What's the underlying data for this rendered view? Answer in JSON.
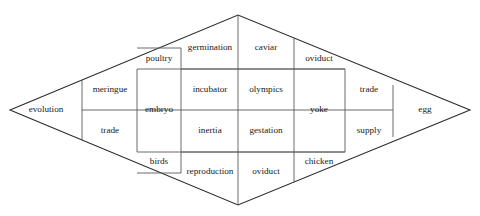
{
  "diagram": {
    "type": "rhombus-partition-diagram",
    "shape": "rhombus",
    "stroke_color": "#2b2b2b",
    "grid_color": "#5a5a5a",
    "background_color": "#ffffff",
    "text_color": "#1a1a1a",
    "vertices": {
      "left": [
        10,
        110
      ],
      "top": [
        238,
        15
      ],
      "right": [
        470,
        110
      ],
      "bottom": [
        238,
        205
      ]
    },
    "columns": [
      {
        "name": "column-evolution",
        "x_start": 10,
        "x_end": 82
      },
      {
        "name": "column-meringue-trade",
        "x_start": 82,
        "x_end": 137
      },
      {
        "name": "column-embryo",
        "x_start": 137,
        "x_end": 181
      },
      {
        "name": "column-germination",
        "x_start": 181,
        "x_end": 238
      },
      {
        "name": "column-caviar",
        "x_start": 238,
        "x_end": 294
      },
      {
        "name": "column-yoke",
        "x_start": 294,
        "x_end": 345
      },
      {
        "name": "column-trade-supply",
        "x_start": 345,
        "x_end": 393
      },
      {
        "name": "column-egg",
        "x_start": 393,
        "x_end": 470
      }
    ],
    "row_dividers_y": [
      48,
      69,
      110,
      152,
      173
    ],
    "cells": [
      {
        "id": "cell-evolution",
        "label": "evolution",
        "cx": 46,
        "cy": 110,
        "column": 1,
        "row": "middle"
      },
      {
        "id": "cell-meringue",
        "label": "meringue",
        "cx": 110,
        "cy": 90,
        "column": 2,
        "row": "upper"
      },
      {
        "id": "cell-trade-left",
        "label": "trade",
        "cx": 110,
        "cy": 131,
        "column": 2,
        "row": "lower"
      },
      {
        "id": "cell-poultry",
        "label": "poultry",
        "cx": 159,
        "cy": 59,
        "column": 3,
        "row": "top"
      },
      {
        "id": "cell-embryo",
        "label": "embryo",
        "cx": 159,
        "cy": 110,
        "column": 3,
        "row": "middle"
      },
      {
        "id": "cell-birds",
        "label": "birds",
        "cx": 159,
        "cy": 162,
        "column": 3,
        "row": "bottom"
      },
      {
        "id": "cell-germination",
        "label": "germination",
        "cx": 210,
        "cy": 48,
        "column": 4,
        "row": "1"
      },
      {
        "id": "cell-incubator",
        "label": "incubator",
        "cx": 210,
        "cy": 90,
        "column": 4,
        "row": "2"
      },
      {
        "id": "cell-inertia",
        "label": "inertia",
        "cx": 210,
        "cy": 131,
        "column": 4,
        "row": "3"
      },
      {
        "id": "cell-reproduction",
        "label": "reproduction",
        "cx": 210,
        "cy": 172,
        "column": 4,
        "row": "4"
      },
      {
        "id": "cell-caviar",
        "label": "caviar",
        "cx": 266,
        "cy": 48,
        "column": 5,
        "row": "1"
      },
      {
        "id": "cell-olympics",
        "label": "olympics",
        "cx": 266,
        "cy": 90,
        "column": 5,
        "row": "2"
      },
      {
        "id": "cell-gestation",
        "label": "gestation",
        "cx": 266,
        "cy": 131,
        "column": 5,
        "row": "3"
      },
      {
        "id": "cell-oviduct-bottom",
        "label": "oviduct",
        "cx": 266,
        "cy": 172,
        "column": 5,
        "row": "4"
      },
      {
        "id": "cell-oviduct-top",
        "label": "oviduct",
        "cx": 319,
        "cy": 59,
        "column": 6,
        "row": "top"
      },
      {
        "id": "cell-yoke",
        "label": "yoke",
        "cx": 319,
        "cy": 110,
        "column": 6,
        "row": "middle"
      },
      {
        "id": "cell-chicken",
        "label": "chicken",
        "cx": 319,
        "cy": 162,
        "column": 6,
        "row": "bottom"
      },
      {
        "id": "cell-trade-right",
        "label": "trade",
        "cx": 369,
        "cy": 90,
        "column": 7,
        "row": "upper"
      },
      {
        "id": "cell-supply",
        "label": "supply",
        "cx": 369,
        "cy": 131,
        "column": 7,
        "row": "lower"
      },
      {
        "id": "cell-egg",
        "label": "egg",
        "cx": 425,
        "cy": 110,
        "column": 8,
        "row": "middle"
      }
    ]
  }
}
